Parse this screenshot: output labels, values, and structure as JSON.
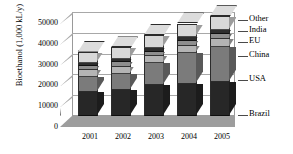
{
  "chart_data": {
    "type": "bar",
    "subtype": "stacked-3d-column",
    "title": "",
    "title_clipped": true,
    "xlabel": "",
    "ylabel": "Bioethanol (1,000 kL/y)",
    "categories": [
      "2001",
      "2002",
      "2003",
      "2004",
      "2005"
    ],
    "ylim": [
      0,
      50000
    ],
    "yticks": [
      0,
      10000,
      20000,
      30000,
      40000,
      50000
    ],
    "ytick_labels": [
      "0",
      "10000",
      "20000",
      "30000",
      "40000",
      "50000"
    ],
    "grid": true,
    "legend_position": "right",
    "series": [
      {
        "name": "Brazil",
        "color": "#272727",
        "values": [
          11500,
          12500,
          14800,
          15600,
          16500
        ]
      },
      {
        "name": "USA",
        "color": "#7b7b7b",
        "values": [
          7200,
          7800,
          10500,
          14800,
          16500
        ]
      },
      {
        "name": "China",
        "color": "#b4b4b4",
        "values": [
          3200,
          3300,
          3400,
          3500,
          3800
        ]
      },
      {
        "name": "EU",
        "color": "#8e8e8e",
        "values": [
          2100,
          2200,
          2300,
          2400,
          2600
        ]
      },
      {
        "name": "India",
        "color": "#2e2e2e",
        "values": [
          1700,
          1800,
          1900,
          1900,
          2000
        ]
      },
      {
        "name": "Other",
        "color": "#d8d8d8",
        "values": [
          5300,
          5400,
          6100,
          6300,
          6600
        ]
      }
    ],
    "totals": [
      31000,
      33000,
      39000,
      44500,
      48000
    ]
  },
  "legend": {
    "entries": [
      "Other",
      "India",
      "EU",
      "China",
      "USA",
      "Brazil"
    ]
  },
  "colors": {
    "background": "#ffffff",
    "floor": "#9d9d9d",
    "left_wall": "#ffffff",
    "axis": "#5a5a5a",
    "gridline": "#a8a8a8",
    "text": "#000000"
  }
}
